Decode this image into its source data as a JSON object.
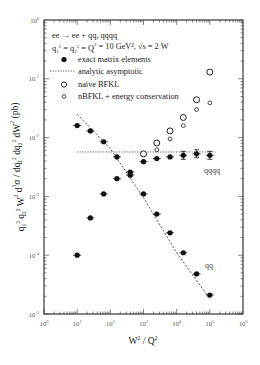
{
  "chart_data": {
    "type": "scatter",
    "title": "",
    "xlabel": "W^2 / Q^2",
    "ylabel": "q1^2 q2^2 W^2 d^3σ / dq1^2 dq2^2 dW^2 (pb)",
    "xscale": "log",
    "yscale": "log",
    "xlim": [
      1,
      1000000
    ],
    "ylim": [
      1e-05,
      1
    ],
    "x_tick_labels": [
      "10^0",
      "10^1",
      "10^2",
      "10^3",
      "10^4",
      "10^5",
      "10^6"
    ],
    "y_tick_labels": [
      "10^0",
      "10^-1",
      "10^-2",
      "10^-3",
      "10^-4",
      "10^-5"
    ],
    "grid": false,
    "legend_position": "upper left (inside)",
    "annotations": [
      "ee → ee + qq, qqqq",
      "q1^2 = q2^2 = Q^2 = 10 GeV^2, √s = 2 W"
    ],
    "curve_labels": [
      "qqqq",
      "qq"
    ],
    "series": [
      {
        "name": "exact matrix elements (qq)",
        "marker": "filled-circle",
        "x": [
          10,
          25,
          63,
          158,
          398,
          1000,
          2512,
          6310,
          15849,
          39811,
          100000
        ],
        "y": [
          0.016,
          0.013,
          0.0085,
          0.0047,
          0.0023,
          0.0011,
          0.0005,
          0.00024,
          0.00011,
          4.8e-05,
          2.1e-05
        ]
      },
      {
        "name": "exact matrix elements (qqqq)",
        "marker": "filled-circle",
        "x": [
          10,
          25,
          63,
          158,
          398,
          1000,
          2512,
          6310,
          15849,
          39811,
          100000
        ],
        "y": [
          0.0001,
          0.00043,
          0.0011,
          0.002,
          0.0026,
          0.0039,
          0.0044,
          0.0047,
          0.005,
          0.0053,
          0.005
        ]
      },
      {
        "name": "naive BFKL",
        "marker": "open-circle",
        "x": [
          1000,
          2512,
          6310,
          15849,
          39811,
          100000
        ],
        "y": [
          0.0053,
          0.0081,
          0.013,
          0.022,
          0.044,
          0.13
        ]
      },
      {
        "name": "nBFKL + energy conservation",
        "marker": "open-diamond",
        "x": [
          2512,
          6310,
          15849,
          39811,
          100000
        ],
        "y": [
          0.0062,
          0.0095,
          0.016,
          0.03,
          0.039
        ]
      },
      {
        "name": "analytic asymptotic (qqqq)",
        "style": "dotted-line",
        "x": [
          10,
          150000
        ],
        "y": [
          0.0057,
          0.0057
        ]
      },
      {
        "name": "analytic asymptotic (qq)",
        "style": "dashed-line",
        "x": [
          10,
          100,
          1000,
          10000,
          100000
        ],
        "y": [
          0.025,
          0.0065,
          0.00095,
          0.00011,
          1.8e-05
        ]
      }
    ]
  },
  "legend": {
    "line1": "ee → ee + qq, qqqq",
    "line2_prefix": "q",
    "line2_text": "= 10 GeV², √s = 2 W",
    "items": [
      {
        "symbol": "filled-circle",
        "label": "exact matrix elements"
      },
      {
        "symbol": "dotted-line",
        "label": "analytic asymptotic"
      },
      {
        "symbol": "open-circle",
        "label": "naive BFKL"
      },
      {
        "symbol": "open-diamond",
        "label": "nBFKL + energy conservation"
      }
    ]
  }
}
